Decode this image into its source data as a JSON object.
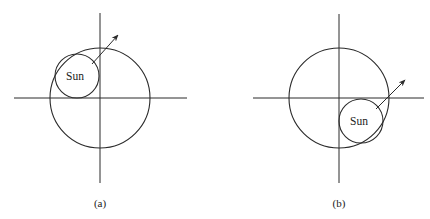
{
  "figure": {
    "panels": [
      {
        "id": "a",
        "caption": "(a)",
        "sun_label": "Sun",
        "axes": {
          "cx": 100,
          "cy": 98,
          "x_range": [
            14,
            187
          ],
          "y_range": [
            13,
            183
          ]
        },
        "orbit": {
          "cx": 100,
          "cy": 98,
          "r": 50
        },
        "sun": {
          "cx": 77,
          "cy": 76,
          "r": 22
        },
        "arrow": {
          "x1": 92,
          "y1": 64,
          "x2": 118,
          "y2": 35
        },
        "caption_pos": {
          "x": 100,
          "y": 207
        }
      },
      {
        "id": "b",
        "caption": "(b)",
        "sun_label": "Sun",
        "axes": {
          "cx": 339,
          "cy": 98,
          "x_range": [
            253,
            424
          ],
          "y_range": [
            14,
            183
          ]
        },
        "orbit": {
          "cx": 339,
          "cy": 98,
          "r": 50
        },
        "sun": {
          "cx": 361,
          "cy": 121,
          "r": 22
        },
        "arrow": {
          "x1": 376,
          "y1": 109,
          "x2": 405,
          "y2": 80
        },
        "caption_pos": {
          "x": 339,
          "y": 207
        }
      }
    ]
  }
}
